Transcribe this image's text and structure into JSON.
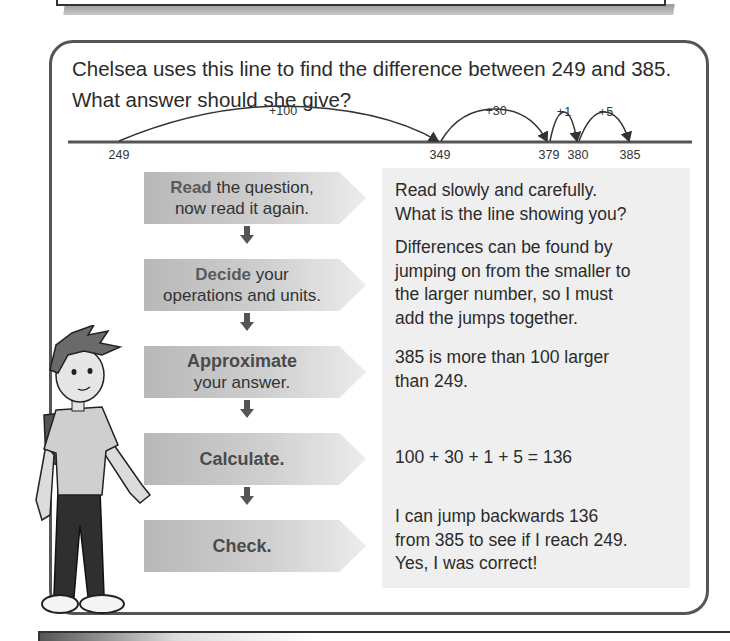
{
  "question": {
    "line1": "Chelsea uses this line to find the difference between 249 and 385.",
    "line2": "What answer should she give?"
  },
  "number_line": {
    "points": [
      {
        "label": "249",
        "x": 119
      },
      {
        "label": "349",
        "x": 440
      },
      {
        "label": "379",
        "x": 549
      },
      {
        "label": "380",
        "x": 578
      },
      {
        "label": "385",
        "x": 630
      }
    ],
    "jumps": [
      {
        "label": "+100",
        "from": "249",
        "to": "349"
      },
      {
        "label": "+30",
        "from": "349",
        "to": "379"
      },
      {
        "label": "+1",
        "from": "379",
        "to": "380"
      },
      {
        "label": "+5",
        "from": "380",
        "to": "385"
      }
    ]
  },
  "steps": [
    {
      "keyword": "Read",
      "rest1": " the question,",
      "rest2": "now read it again.",
      "explanation": [
        "Read slowly and carefully.",
        "What is the line showing you?"
      ]
    },
    {
      "keyword": "Decide",
      "rest1": " your",
      "rest2": "operations and units.",
      "explanation": [
        "Differences can be found by",
        "jumping on from the smaller to",
        "the larger number, so I must",
        "add the jumps together."
      ]
    },
    {
      "keyword": "Approximate",
      "rest1": "",
      "rest2": "your answer.",
      "explanation": [
        "385 is more than 100 larger",
        "than 249."
      ]
    },
    {
      "keyword": "Calculate.",
      "rest1": "",
      "rest2": "",
      "explanation": [
        "100 + 30 + 1 + 5 = 136"
      ]
    },
    {
      "keyword": "Check.",
      "rest1": "",
      "rest2": "",
      "explanation": [
        "I can jump backwards 136",
        "from 385 to see if I reach 249.",
        "Yes, I was correct!"
      ]
    }
  ],
  "icons": {
    "step_arrow": "down-arrow-icon",
    "character": "boy-character-illustration"
  },
  "colors": {
    "border": "#555555",
    "explanation_bg": "#efefef",
    "chevron_dark": "#b8b8b8",
    "chevron_light": "#ececec",
    "text": "#2b2b2b"
  }
}
